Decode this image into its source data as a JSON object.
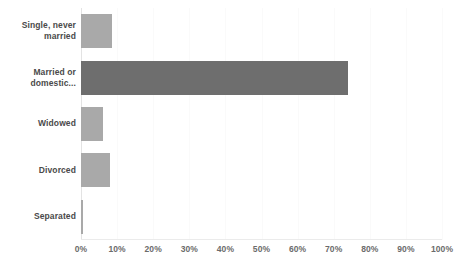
{
  "chart_data": {
    "type": "bar",
    "orientation": "horizontal",
    "title": "",
    "xlabel": "",
    "ylabel": "",
    "categories": [
      "Single, never married",
      "Married or domestic...",
      "Widowed",
      "Divorced",
      "Separated"
    ],
    "values": [
      8.5,
      74,
      6,
      8,
      0.5
    ],
    "value_suffix": "%",
    "xlim": [
      0,
      100
    ],
    "xticks": [
      0,
      10,
      20,
      30,
      40,
      50,
      60,
      70,
      80,
      90,
      100
    ],
    "xtick_labels": [
      "0%",
      "10%",
      "20%",
      "30%",
      "40%",
      "50%",
      "60%",
      "70%",
      "80%",
      "90%",
      "100%"
    ],
    "grid": true,
    "grid_axis": "x",
    "legend": false,
    "bar_colors": [
      "#a9a9a9",
      "#6e6e6e",
      "#a9a9a9",
      "#a9a9a9",
      "#a9a9a9"
    ],
    "highlight_index": 1,
    "colors": {
      "bar_default": "#a9a9a9",
      "bar_highlight": "#6e6e6e",
      "gridline": "#fafafa",
      "axis": "#e3e3e3",
      "label_text": "#4a4a4a",
      "tick_text": "#6b6b6b",
      "background": "#ffffff"
    }
  }
}
